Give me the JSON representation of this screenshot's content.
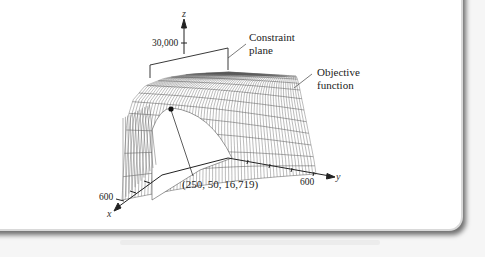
{
  "figure": {
    "type": "3d-surface-plot",
    "axes": {
      "x": {
        "label": "x",
        "tick_label": "600"
      },
      "y": {
        "label": "y",
        "tick_label": "600"
      },
      "z": {
        "label": "z",
        "tick_label": "30,000"
      }
    },
    "annotations": {
      "constraint_plane": [
        "Constraint",
        "plane"
      ],
      "objective_function": [
        "Objective",
        "function"
      ],
      "point_label": "(250, 50, 16,719)"
    },
    "point": {
      "x": 250,
      "y": 50,
      "z": 16719
    },
    "colors": {
      "panel_bg": "#ffffff",
      "page_bg": "#f6f6f6",
      "line": "#3a3a3a",
      "mesh": "#555555"
    }
  }
}
